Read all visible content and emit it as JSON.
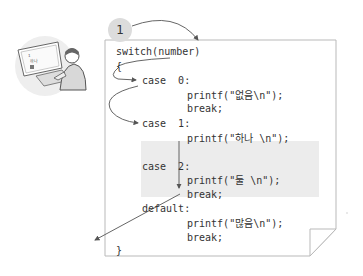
{
  "badge": {
    "label": "1"
  },
  "colors": {
    "paper_border": "#b9b9b9",
    "shade": "#ececec",
    "arrow": "#555555",
    "text": "#333333",
    "badge_bg": "#dcdcdc"
  },
  "illustration": {
    "icon": "person-at-computer-icon",
    "screen_text": [
      "1",
      "하나",
      "둘"
    ]
  },
  "code": {
    "lines": [
      {
        "text": "switch(number)",
        "x": 116,
        "y": 46
      },
      {
        "text": "{",
        "x": 116,
        "y": 61
      },
      {
        "text": "case  0:",
        "x": 142,
        "y": 75
      },
      {
        "text": "printf(\"없음\\n\");",
        "x": 187,
        "y": 90
      },
      {
        "text": "break;",
        "x": 187,
        "y": 103
      },
      {
        "text": "case  1:",
        "x": 142,
        "y": 118
      },
      {
        "text": "printf(\"하나 \\n\");",
        "x": 187,
        "y": 133
      },
      {
        "text": "case  2:",
        "x": 142,
        "y": 161
      },
      {
        "text": "printf(\"둘 \\n\");",
        "x": 187,
        "y": 175
      },
      {
        "text": "break;",
        "x": 187,
        "y": 189
      },
      {
        "text": "default:",
        "x": 142,
        "y": 203
      },
      {
        "text": "printf(\"많음\\n\");",
        "x": 187,
        "y": 218
      },
      {
        "text": "break;",
        "x": 187,
        "y": 232
      },
      {
        "text": "}",
        "x": 116,
        "y": 245
      }
    ]
  },
  "highlight": {
    "label": "fall-through region (case 1 to case 2 break)"
  }
}
